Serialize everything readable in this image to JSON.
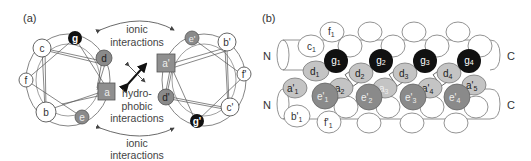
{
  "panel_a": {
    "label": "(a)",
    "top_annotation": [
      "ionic",
      "interactions"
    ],
    "bottom_annotation": [
      "ionic",
      "interactions"
    ],
    "center_annotation": [
      "hydro-",
      "phobic",
      "interactions"
    ],
    "left_wheel": {
      "residues": [
        {
          "id": "g",
          "label": "g",
          "type": "ionic-dark"
        },
        {
          "id": "c",
          "label": "c",
          "type": "outer"
        },
        {
          "id": "d",
          "label": "d",
          "type": "hydrophobic-grey"
        },
        {
          "id": "f",
          "label": "f",
          "type": "outer"
        },
        {
          "id": "a",
          "label": "a",
          "type": "hydrophobic-square"
        },
        {
          "id": "b",
          "label": "b",
          "type": "outer"
        },
        {
          "id": "e",
          "label": "e",
          "type": "ionic-grey"
        }
      ]
    },
    "right_wheel": {
      "residues": [
        {
          "id": "e'",
          "label": "e'",
          "type": "ionic-grey"
        },
        {
          "id": "b'",
          "label": "b'",
          "type": "outer"
        },
        {
          "id": "a'",
          "label": "a'",
          "type": "hydrophobic-square"
        },
        {
          "id": "f'",
          "label": "f'",
          "type": "outer"
        },
        {
          "id": "d'",
          "label": "d'",
          "type": "hydrophobic-grey"
        },
        {
          "id": "c'",
          "label": "c'",
          "type": "outer"
        },
        {
          "id": "g'",
          "label": "g'",
          "type": "ionic-dark"
        }
      ]
    }
  },
  "panel_b": {
    "label": "(b)",
    "termini": {
      "top_left": "N",
      "bottom_left": "N",
      "top_right": "C",
      "bottom_right": "C"
    },
    "top_helix_labels": {
      "c1": "c",
      "c1_sub": "1",
      "f1": "f",
      "f1_sub": "1"
    },
    "g_residues": [
      {
        "base": "g",
        "sub": "1"
      },
      {
        "base": "g",
        "sub": "2"
      },
      {
        "base": "g",
        "sub": "3"
      },
      {
        "base": "g",
        "sub": "4"
      }
    ],
    "d_residues": [
      {
        "base": "d",
        "sub": "1"
      },
      {
        "base": "d",
        "sub": "2"
      },
      {
        "base": "d",
        "sub": "3"
      },
      {
        "base": "d",
        "sub": "4"
      }
    ],
    "a_residues": [
      {
        "base": "a'",
        "sub": "1"
      },
      {
        "base": "a",
        "sub": "2"
      },
      {
        "base": "a",
        "sub": "3"
      },
      {
        "base": "a'",
        "sub": "4"
      },
      {
        "base": "a'",
        "sub": "5"
      }
    ],
    "e_residues": [
      {
        "base": "e'",
        "sub": "1"
      },
      {
        "base": "e'",
        "sub": "2"
      },
      {
        "base": "e'",
        "sub": "3"
      },
      {
        "base": "e'",
        "sub": "4"
      }
    ],
    "bottom_helix_labels": {
      "b1": "b'",
      "b1_sub": "1",
      "f1": "f'",
      "f1_sub": "1"
    }
  },
  "colors": {
    "dark": "#111111",
    "mid_grey": "#8a8a8a",
    "light_grey": "#c4c4c4",
    "square_grey": "#8f8f8f",
    "line": "#555555"
  }
}
